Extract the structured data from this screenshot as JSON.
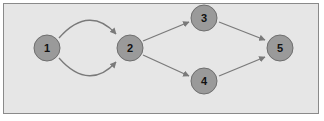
{
  "diagram": {
    "type": "directed-graph",
    "colors": {
      "background": "#e6e6e6",
      "border": "#8a8a8a",
      "node_fill": "#9a9a9a",
      "node_stroke": "#6e6e6e",
      "edge": "#7a7a7a",
      "label": "#111111"
    },
    "nodes": [
      {
        "id": "1",
        "label": "1",
        "x": 47,
        "y": 79
      },
      {
        "id": "2",
        "label": "2",
        "x": 130,
        "y": 92
      },
      {
        "id": "3",
        "label": "3",
        "x": 205,
        "y": 64
      },
      {
        "id": "4",
        "label": "4",
        "x": 205,
        "y": 116
      },
      {
        "id": "5",
        "label": "5",
        "x": 282,
        "y": 92
      }
    ],
    "edges": [
      {
        "from": "1",
        "to": "2",
        "style": "curved-upper"
      },
      {
        "from": "1",
        "to": "2",
        "style": "curved-lower"
      },
      {
        "from": "2",
        "to": "3",
        "style": "straight"
      },
      {
        "from": "2",
        "to": "4",
        "style": "straight"
      },
      {
        "from": "3",
        "to": "5",
        "style": "straight"
      },
      {
        "from": "4",
        "to": "5",
        "style": "straight"
      }
    ]
  }
}
